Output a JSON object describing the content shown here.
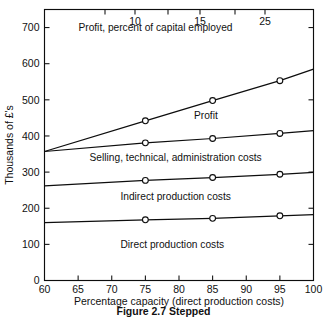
{
  "chart_data": {
    "type": "line",
    "title": "",
    "xlabel": "Percentage capacity (direct production costs)",
    "ylabel": "Thousands of £'s",
    "top_axis_label": "Profit, percent of capital employed",
    "xlim": [
      60,
      100
    ],
    "ylim": [
      0,
      750
    ],
    "grid": false,
    "legend_position": "inline-annotations",
    "x_ticks": [
      60,
      65,
      70,
      75,
      80,
      85,
      90,
      95,
      100
    ],
    "x_tick_labels": [
      "60",
      "65",
      "70",
      "75",
      "80",
      "85",
      "90",
      "95",
      "100"
    ],
    "y_ticks": [
      0,
      100,
      200,
      300,
      400,
      500,
      600,
      700
    ],
    "y_tick_labels": [
      "0",
      "100",
      "200",
      "300",
      "400",
      "500",
      "600",
      "700"
    ],
    "top_axis_ticks": [
      5,
      7.5,
      10,
      12.5,
      15,
      20,
      25
    ],
    "top_axis_tick_labels": [
      "",
      "",
      "10",
      "",
      "15",
      "",
      "25"
    ],
    "top_axis_labeled_ticks": [
      {
        "label": "10",
        "x_capacity": 75
      },
      {
        "label": "15",
        "x_capacity": 85
      },
      {
        "label": "25",
        "x_capacity": 95
      }
    ],
    "x": [
      60,
      75,
      85,
      95,
      100
    ],
    "series": [
      {
        "name": "Direct production costs",
        "values": [
          160,
          168,
          172,
          179,
          182
        ],
        "markers_at": [
          75,
          85,
          95
        ]
      },
      {
        "name": "Indirect production costs",
        "values": [
          262,
          277,
          285,
          294,
          299
        ],
        "markers_at": [
          75,
          85,
          95
        ]
      },
      {
        "name": "Selling, technical, administration costs",
        "values": [
          357,
          381,
          393,
          407,
          415
        ],
        "markers_at": [
          75,
          85,
          95
        ]
      },
      {
        "name": "Profit",
        "values": [
          357,
          442,
          498,
          553,
          585
        ],
        "markers_at": [
          75,
          85,
          95
        ]
      }
    ],
    "band_annotations": [
      {
        "text": "Profit, percent of capital employed",
        "x_capacity": 76.5,
        "y_value": 690
      },
      {
        "text": "Profit",
        "x_capacity": 84.0,
        "y_value": 447
      },
      {
        "text": "Selling, technical, administration costs",
        "x_capacity": 79.5,
        "y_value": 330
      },
      {
        "text": "Indirect production costs",
        "x_capacity": 79.5,
        "y_value": 222
      },
      {
        "text": "Direct production costs",
        "x_capacity": 79.0,
        "y_value": 90
      }
    ],
    "colors": {
      "line": "#0d0d0d",
      "marker_fill": "#ffffff",
      "axis": "#0d0d0d",
      "background": "#ffffff"
    }
  },
  "caption": {
    "text": "Figure 2.7  Stepped"
  }
}
